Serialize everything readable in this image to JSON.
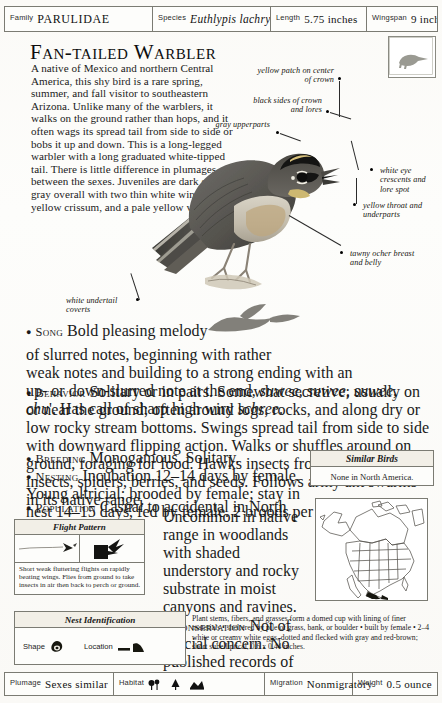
{
  "header": {
    "family_label": "Family",
    "family_value": "PARULIDAE",
    "species_label": "Species",
    "species_value": "Euthlypis lachrymosa",
    "length_label": "Length",
    "length_value": "5.75 inches",
    "wingspan_label": "Wingspan",
    "wingspan_value": "9 inches"
  },
  "title": "Fan-tailed Warbler",
  "intro": "A native of Mexico and northern Central America, this shy bird is a rare spring, summer, and fall visitor to southeastern Arizona. Unlike many of the warblers, it walks on the ground rather than hops, and it often wags its spread tail from side to side or bobs it up and down. This is a long-legged warbler with a long graduated white-tipped tail. There is little difference in plumages between the sexes. Juveniles are dark sooty gray overall with two thin white wing bars, a yellow crissum, and a pale yellow vent.",
  "callouts": [
    {
      "id": "yellow-crown",
      "text": "yellow patch on center of crown"
    },
    {
      "id": "black-sides",
      "text": "black sides of crown and lores"
    },
    {
      "id": "gray-upperparts",
      "text": "gray upperparts"
    },
    {
      "id": "white-eye-crescents",
      "text": "white eye crescents and lore spot"
    },
    {
      "id": "yellow-throat",
      "text": "yellow throat and underparts"
    },
    {
      "id": "tawny-breast",
      "text": "tawny ocher breast and belly"
    },
    {
      "id": "white-undertail",
      "text": "white undertail coverts"
    }
  ],
  "sections": {
    "song_head": "Song",
    "song_part1": "Bold pleasing melody",
    "song_part2": "of slurred notes, beginning with rather",
    "song_part3": "weak notes and building to a strong ending with an",
    "song_part4_pre": "up- or down-slurred note at the end,",
    "song_part4_it": "suwee, suwee, suwee, chu",
    "song_part4_post": "'. Has call of sharp high wiry",
    "song_part4_it2": "schree",
    "song_part4_end": ".",
    "behavior_head": "Behavior",
    "behavior_body": "Solitary or in pairs. Somewhat secretive; usually on or near the ground; often around logs, rocks, and along dry or low rocky stream bottoms. Swings spread tail from side to side with downward flipping action. Walks or shuffles around on ground, foraging for food. Hawks insects from ground. Eats insects, spiders, berries, and seeds. Follows army ant swarms in its native range.",
    "breeding_head": "Breeding",
    "breeding_body": "Monogamous. Solitary.",
    "nesting_head": "Nesting",
    "nesting_body": "Incubation 12–14 days by female. Young altricial; brooded by female; stay in nest 14–15 days, fed by female. 2 broods per year.",
    "population_head": "Population",
    "population_body": "Casual to accidental in North America.",
    "population_body2": "Uncommon in native range in woodlands with shaded understory and rocky substrate in moist canyons and ravines.",
    "conservation_head": "Conservation",
    "conservation_body": "Not of special concern. No published records of cowbird parasitism."
  },
  "similar_birds": {
    "title": "Similar Birds",
    "body": "None in North America."
  },
  "flight_pattern": {
    "title": "Flight Pattern",
    "caption": "Short weak fluttering flights on rapidly beating wings. Flies from ground to take insects in air then back to perch or ground."
  },
  "nest_identification": {
    "title": "Nest Identification",
    "shape_label": "Shape",
    "location_label": "Location",
    "description": "Plant stems, fibers, and grasses form a domed cup with lining of finer materials • sheltered by pile of grass, bank, or boulder • built by female • 2–4 white or creamy white eggs, dotted and flecked with gray and red-brown; short subelliptical, 0.6 x 0.44 inches."
  },
  "footer": {
    "plumage_label": "Plumage",
    "plumage_value": "Sexes similar",
    "habitat_label": "Habitat",
    "habitat_icons": [
      "shrub-icon",
      "conifer-icon",
      "rocky-slope-icon"
    ],
    "migration_label": "Migration",
    "migration_value": "Nonmigratory",
    "weight_label": "Weight",
    "weight_value": "0.5 ounce"
  },
  "colors": {
    "rule": "#7b7b73",
    "header_fill": "#f2efe7",
    "ink": "#161616",
    "range": "#1a1a1a"
  }
}
